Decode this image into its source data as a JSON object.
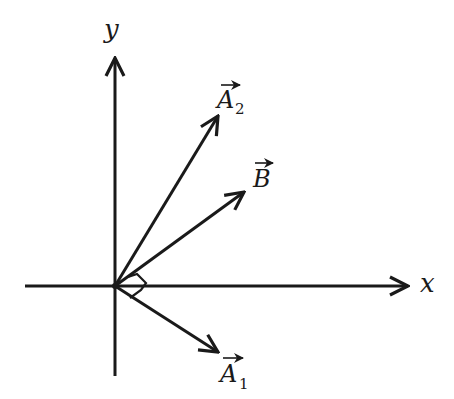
{
  "diagram": {
    "type": "vector-diagram",
    "axes": {
      "x_label": "x",
      "y_label": "y"
    },
    "vectors": [
      {
        "name": "A2",
        "label_main": "A",
        "label_sub": "2",
        "direction": "up-right steep"
      },
      {
        "name": "B",
        "label_main": "B",
        "label_sub": "",
        "direction": "up-right shallow"
      },
      {
        "name": "A1",
        "label_main": "A",
        "label_sub": "1",
        "direction": "down-right"
      }
    ],
    "annotations": [
      "right-angle marker between B and A1"
    ],
    "colors": {
      "ink": "#1a1a1a",
      "background": "#ffffff"
    }
  }
}
